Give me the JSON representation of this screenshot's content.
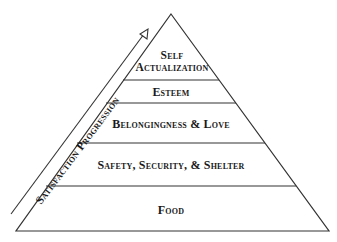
{
  "diagram": {
    "type": "pyramid",
    "arrow_label": "Satisfaction Progression",
    "levels": [
      {
        "label_line1": "Self",
        "label_line2": "Actualization"
      },
      {
        "label": "Esteem"
      },
      {
        "label": "Belongingness & Love"
      },
      {
        "label": "Safety, Security, & Shelter"
      },
      {
        "label": "Food"
      }
    ],
    "colors": {
      "line": "#333333",
      "text": "#1a1a1a",
      "background": "#ffffff"
    }
  }
}
